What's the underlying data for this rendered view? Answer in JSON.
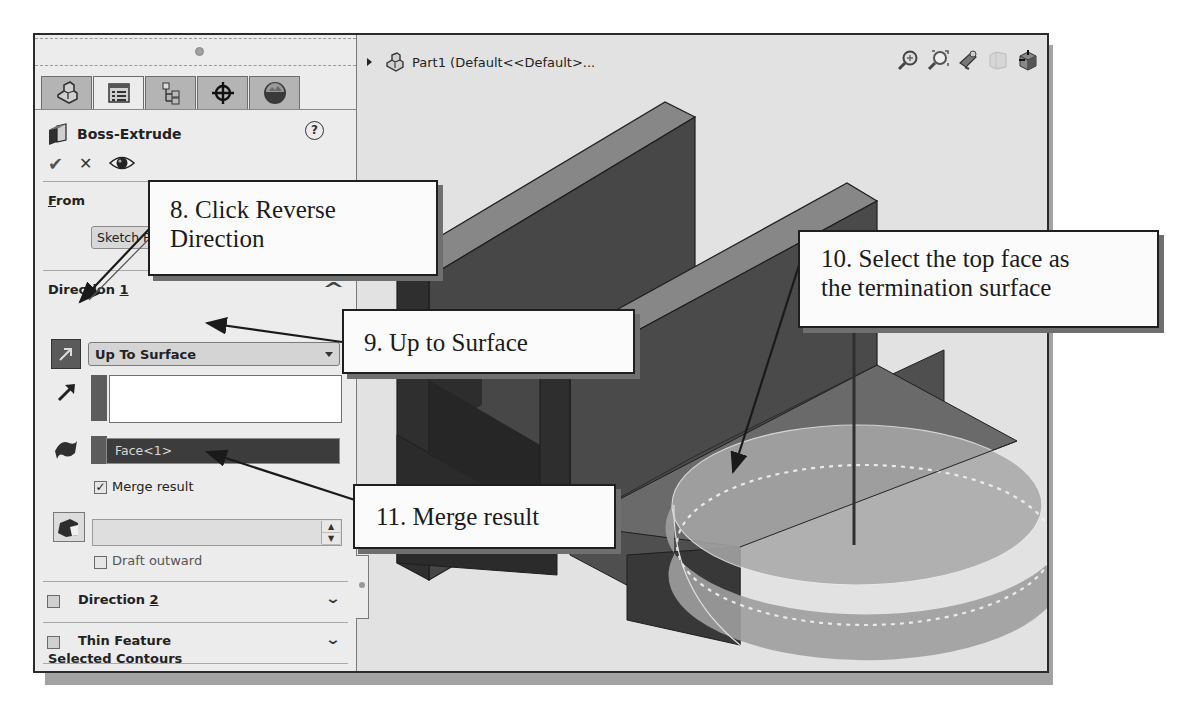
{
  "property_manager": {
    "tabs": [
      {
        "name": "featuremanager-tab",
        "icon": "part-tree-icon",
        "active": false
      },
      {
        "name": "propertymanager-tab",
        "icon": "property-list-icon",
        "active": true
      },
      {
        "name": "configurationmanager-tab",
        "icon": "configuration-icon",
        "active": false
      },
      {
        "name": "dimxpert-tab",
        "icon": "crosshair-target-icon",
        "active": false
      },
      {
        "name": "display-manager-tab",
        "icon": "appearance-sphere-icon",
        "active": false
      }
    ],
    "title": "Boss-Extrude",
    "help_glyph": "?",
    "actions": {
      "ok": "✔",
      "cancel": "✕",
      "preview": "eye"
    },
    "from": {
      "label_prefix": "F",
      "label_rest": "rom",
      "value": "Sketch Plane"
    },
    "direction1": {
      "label": "Direction ",
      "label_num": "1",
      "end_condition": "Up To Surface",
      "direction_list_value": "",
      "face_value": "Face<1>",
      "merge_result_label": "Merge result",
      "merge_result_checked": true,
      "merge_check_glyph": "✓",
      "draft_value": "",
      "draft_outward_label": "Draft outward",
      "draft_outward_checked": false,
      "collapse_glyph": "^"
    },
    "groups": [
      {
        "label": "Direction ",
        "label_num": "2",
        "checked": false,
        "has_checkbox": true
      },
      {
        "label": "Thin Feature",
        "underline_first": "T",
        "checked": false,
        "has_checkbox": true
      },
      {
        "label": "Selected Contours",
        "underline_first": "S",
        "has_checkbox": false
      }
    ],
    "chevron": "⌄"
  },
  "viewport": {
    "tree_title": "Part1  (Default<<Default>...",
    "hud_icons": [
      "zoom-to-fit-icon",
      "zoom-to-area-icon",
      "previous-view-icon",
      "section-view-icon",
      "view-orientation-icon"
    ],
    "hud_dropdown": "▾"
  },
  "callouts": {
    "step8": {
      "line1": "8. Click Reverse",
      "line2": "Direction"
    },
    "step9": {
      "line1": "9. Up to Surface"
    },
    "step10": {
      "line1": "10. Select the top face as",
      "line2": "the termination surface"
    },
    "step11": {
      "line1": "11. Merge result"
    }
  },
  "colors": {
    "panel_bg": "#ececec",
    "viewport_bg": "#e2e2e2",
    "model_top": "#8a8a8a",
    "model_front": "#4a4a4a",
    "model_side": "#2e2e2e",
    "selected_face": "#3c3c3c",
    "preview": "#a9a9a9"
  }
}
